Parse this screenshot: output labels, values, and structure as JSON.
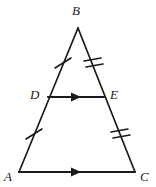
{
  "figure": {
    "type": "geometry-diagram",
    "shape": "triangle",
    "background_color": "#ffffff",
    "stroke_color": "#1a1a1a",
    "label_color": "#1a1a1a"
  },
  "vertices": [
    {
      "id": "A",
      "label": "A",
      "x": 19,
      "y": 172,
      "label_x": 4,
      "label_y": 170
    },
    {
      "id": "B",
      "label": "B",
      "x": 78,
      "y": 28,
      "label_x": 72,
      "label_y": 4
    },
    {
      "id": "C",
      "label": "C",
      "x": 135,
      "y": 172,
      "label_x": 140,
      "label_y": 170
    },
    {
      "id": "D",
      "label": "D",
      "x": 48,
      "y": 97,
      "label_x": 30,
      "label_y": 88
    },
    {
      "id": "E",
      "label": "E",
      "x": 105,
      "y": 97,
      "label_x": 110,
      "label_y": 88
    }
  ],
  "segments": [
    {
      "id": "BD",
      "from": "B",
      "to": "D",
      "tick_count": 1
    },
    {
      "id": "DA",
      "from": "D",
      "to": "A",
      "tick_count": 1
    },
    {
      "id": "BE",
      "from": "B",
      "to": "E",
      "tick_count": 2
    },
    {
      "id": "EC",
      "from": "E",
      "to": "C",
      "tick_count": 2
    },
    {
      "id": "DE",
      "from": "D",
      "to": "E",
      "tick_count": 0,
      "arrow_count": 1
    },
    {
      "id": "AC",
      "from": "A",
      "to": "C",
      "tick_count": 0,
      "arrow_count": 1
    }
  ],
  "tick_marks": [
    {
      "on_segment": "BD",
      "count": 1,
      "cx": 63,
      "cy": 63
    },
    {
      "on_segment": "DA",
      "count": 1,
      "cx": 34,
      "cy": 134
    },
    {
      "on_segment": "BE",
      "count": 2,
      "cx": 93,
      "cy": 63
    },
    {
      "on_segment": "EC",
      "count": 2,
      "cx": 120,
      "cy": 134
    }
  ],
  "arrow_marks": [
    {
      "on_segment": "DE",
      "cx": 77,
      "cy": 97,
      "direction": "right"
    },
    {
      "on_segment": "AC",
      "cx": 77,
      "cy": 172,
      "direction": "right"
    }
  ],
  "relations": {
    "parallel_pair": "DE is parallel to AC",
    "congruent_pair_1": "BD equals DA",
    "congruent_pair_2": "BE equals EC"
  }
}
